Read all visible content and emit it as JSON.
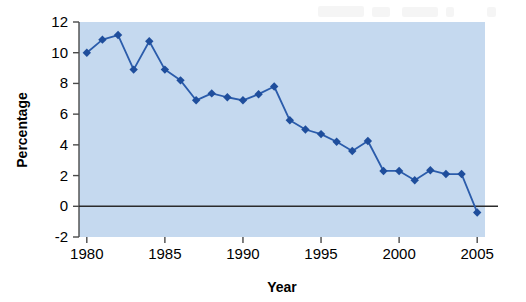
{
  "chart_data": {
    "type": "line",
    "title": "",
    "xlabel": "Year",
    "ylabel": "Percentage",
    "xlim": [
      1979.5,
      2005.5
    ],
    "ylim": [
      -2,
      12
    ],
    "grid": false,
    "legend": "none",
    "x_ticks": [
      1980,
      1985,
      1990,
      1995,
      2000,
      2005
    ],
    "x_tick_labels": [
      "1980",
      "1985",
      "1990",
      "1995",
      "2000",
      "2005"
    ],
    "y_ticks": [
      -2,
      0,
      2,
      4,
      6,
      8,
      10,
      12
    ],
    "y_tick_labels": [
      "-2",
      "0",
      "2",
      "4",
      "6",
      "8",
      "10",
      "12"
    ],
    "zero_line": 0,
    "marker": "diamond",
    "series": [
      {
        "name": "Percentage",
        "line_color": "#2b5cab",
        "marker_color": "#1f4e9c",
        "x": [
          1980,
          1981,
          1982,
          1983,
          1984,
          1985,
          1986,
          1987,
          1988,
          1989,
          1990,
          1991,
          1992,
          1993,
          1994,
          1995,
          1996,
          1997,
          1998,
          1999,
          2000,
          2001,
          2002,
          2003,
          2004,
          2005
        ],
        "values": [
          10.0,
          10.85,
          11.15,
          8.9,
          10.75,
          8.9,
          8.2,
          6.9,
          7.35,
          7.1,
          6.9,
          7.3,
          7.8,
          5.6,
          5.0,
          4.7,
          4.2,
          3.6,
          4.25,
          2.3,
          2.3,
          1.7,
          2.35,
          2.1,
          2.1,
          -0.4
        ]
      }
    ]
  },
  "plot_area": {
    "background_color": "#c5d9ef",
    "left": 79,
    "top": 22,
    "right": 485,
    "bottom": 237
  }
}
